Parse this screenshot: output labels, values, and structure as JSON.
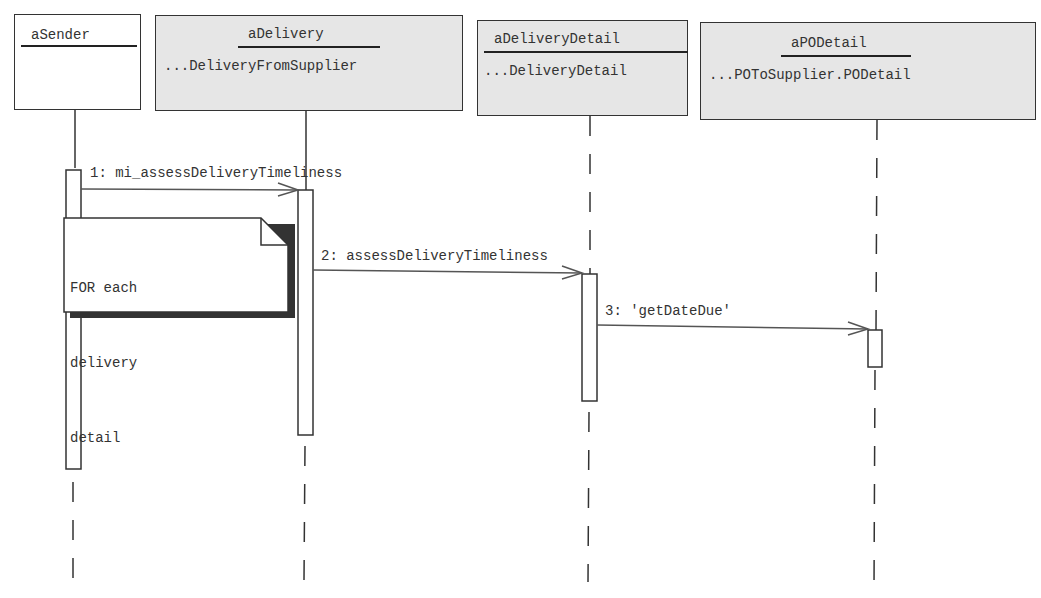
{
  "diagram": {
    "type": "uml-sequence",
    "objects": [
      {
        "name": "aSender",
        "class": ""
      },
      {
        "name": "aDelivery",
        "class": "...DeliveryFromSupplier"
      },
      {
        "name": "aDeliveryDetail",
        "class": "...DeliveryDetail"
      },
      {
        "name": "aPODetail",
        "class": "...POToSupplier.PODetail"
      }
    ],
    "messages": [
      {
        "label": "1: mi_assessDeliveryTimeliness",
        "from": "aSender",
        "to": "aDelivery"
      },
      {
        "label": "2: assessDeliveryTimeliness",
        "from": "aDelivery",
        "to": "aDeliveryDetail"
      },
      {
        "label": "3: 'getDateDue'",
        "from": "aDeliveryDetail",
        "to": "aPODetail"
      }
    ],
    "note": {
      "lines": [
        "FOR each",
        "delivery",
        "detail"
      ]
    }
  }
}
